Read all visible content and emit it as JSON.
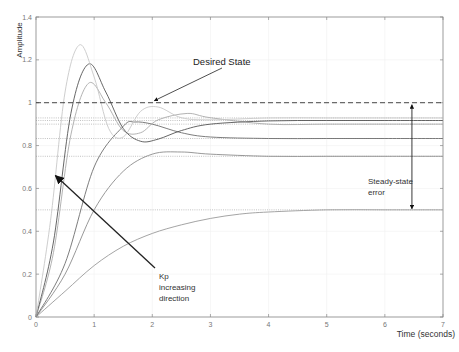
{
  "chart_data": {
    "type": "line",
    "title": "",
    "xlabel": "Time (seconds)",
    "ylabel": "Amplitude",
    "xlim": [
      0,
      7
    ],
    "ylim": [
      0,
      1.4
    ],
    "xticks": [
      "0",
      "1",
      "2",
      "3",
      "4",
      "5",
      "6",
      "7"
    ],
    "yticks": [
      "0",
      "0.2",
      "0.4",
      "0.6",
      "0.8",
      "1",
      "1.2",
      "1.4"
    ],
    "grid": true,
    "legend": null,
    "reference_line": {
      "label": "Desired State",
      "y": 1.0,
      "style": "dashed"
    },
    "steady_state_levels": [
      0.5,
      0.75,
      0.833,
      0.9,
      0.917,
      0.929
    ],
    "series": [
      {
        "name": "Kp1",
        "steady_state": 0.5,
        "peak_time": null,
        "peak": 0.5,
        "color": "#9a9a9a",
        "x": [
          0,
          0.5,
          1,
          1.5,
          2,
          2.5,
          3,
          3.5,
          4,
          5,
          6,
          7
        ],
        "y": [
          0,
          0.12,
          0.24,
          0.33,
          0.39,
          0.43,
          0.46,
          0.48,
          0.49,
          0.5,
          0.5,
          0.5
        ]
      },
      {
        "name": "Kp2",
        "steady_state": 0.75,
        "peak_time": 2.3,
        "peak": 0.77,
        "color": "#8c8c8c",
        "x": [
          0,
          0.5,
          1,
          1.5,
          2,
          2.5,
          3,
          4,
          5,
          6,
          7
        ],
        "y": [
          0,
          0.2,
          0.5,
          0.68,
          0.76,
          0.77,
          0.76,
          0.75,
          0.75,
          0.75,
          0.75
        ]
      },
      {
        "name": "Kp3",
        "steady_state": 0.833,
        "peak_time": 1.7,
        "peak": 0.91,
        "color": "#6e6e6e",
        "x": [
          0,
          0.5,
          1,
          1.5,
          1.7,
          2,
          2.5,
          3,
          4,
          5,
          6,
          7
        ],
        "y": [
          0,
          0.25,
          0.7,
          0.89,
          0.91,
          0.9,
          0.86,
          0.84,
          0.833,
          0.833,
          0.833,
          0.833
        ]
      },
      {
        "name": "Kp4",
        "steady_state": 0.9,
        "peak_time": 0.9,
        "peak": 1.09,
        "color": "#aaaaaa",
        "x": [
          0,
          0.3,
          0.6,
          0.9,
          1.2,
          1.5,
          1.8,
          2.1,
          2.6,
          3,
          4,
          5,
          6,
          7
        ],
        "y": [
          0,
          0.3,
          0.85,
          1.09,
          1.0,
          0.87,
          0.86,
          0.92,
          0.95,
          0.93,
          0.9,
          0.9,
          0.9,
          0.9
        ]
      },
      {
        "name": "Kp5",
        "steady_state": 0.917,
        "peak_time": 0.9,
        "peak": 1.18,
        "color": "#555555",
        "x": [
          0,
          0.3,
          0.6,
          0.9,
          1.2,
          1.5,
          1.8,
          2.1,
          2.5,
          3,
          4,
          5,
          6,
          7
        ],
        "y": [
          0,
          0.35,
          0.95,
          1.18,
          1.05,
          0.88,
          0.82,
          0.83,
          0.87,
          0.9,
          0.915,
          0.917,
          0.917,
          0.917
        ]
      },
      {
        "name": "Kp6",
        "steady_state": 0.929,
        "peak_time": 0.75,
        "peak": 1.27,
        "color": "#c8c8c8",
        "x": [
          0,
          0.25,
          0.5,
          0.75,
          1.0,
          1.25,
          1.5,
          1.8,
          2.1,
          2.5,
          3,
          4,
          5,
          6,
          7
        ],
        "y": [
          0,
          0.45,
          1.05,
          1.27,
          1.12,
          0.88,
          0.84,
          0.96,
          0.98,
          0.93,
          0.92,
          0.929,
          0.929,
          0.929,
          0.929
        ]
      }
    ],
    "annotations": [
      {
        "text": "Desired State",
        "x": 2.2,
        "y": 1.11,
        "arrow_to": [
          2.0,
          1.0
        ]
      },
      {
        "text": "Steady-state error",
        "x": 5.7,
        "y": 0.6,
        "double_arrow": [
          6.5,
          0.5,
          6.5,
          1.0
        ]
      },
      {
        "text": "Kp increasing direction",
        "x": 2.0,
        "y": 0.28,
        "arrow_to": [
          0.3,
          0.66
        ]
      }
    ]
  },
  "labels": {
    "xlabel": "Time (seconds)",
    "ylabel": "Amplitude",
    "desired_state": "Desired State",
    "sse_line1": "Steady-state",
    "sse_line2": "error",
    "kp_line1": "Kp",
    "kp_line2": "increasing",
    "kp_line3": "direction"
  }
}
